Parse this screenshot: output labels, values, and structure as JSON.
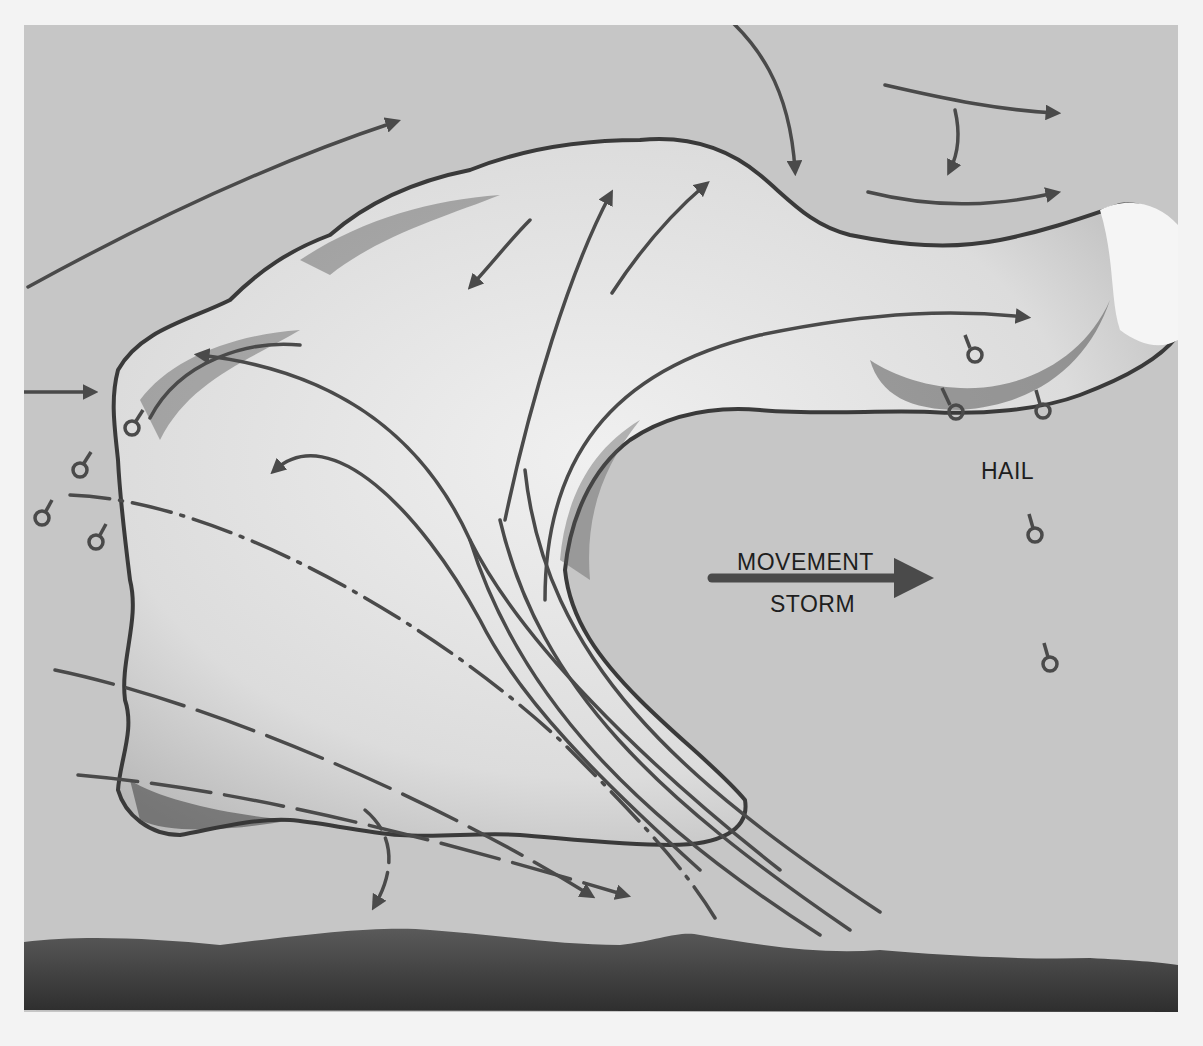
{
  "diagram": {
    "labels": {
      "hail": "HAIL",
      "movement": "MOVEMENT",
      "storm": "STORM"
    },
    "elements": {
      "cloud": "storm cloud with anvil extending right",
      "updraft_arrows": "curved arrows rising through cloud",
      "downdraft_lines": "parallel diagonal streamlines and dash-dot lines descending to lower right",
      "hail_symbols": "small circles with stems scattered below anvil and at left flank",
      "ground": "dark hills along bottom"
    },
    "colors": {
      "sky": "#c6c6c6",
      "arrow": "#4a4a4a",
      "cloud_light": "#e9e9e9",
      "cloud_shadow": "#3a3a3a",
      "ground": "#3c3c3c",
      "border": "#f3f3f3"
    }
  }
}
